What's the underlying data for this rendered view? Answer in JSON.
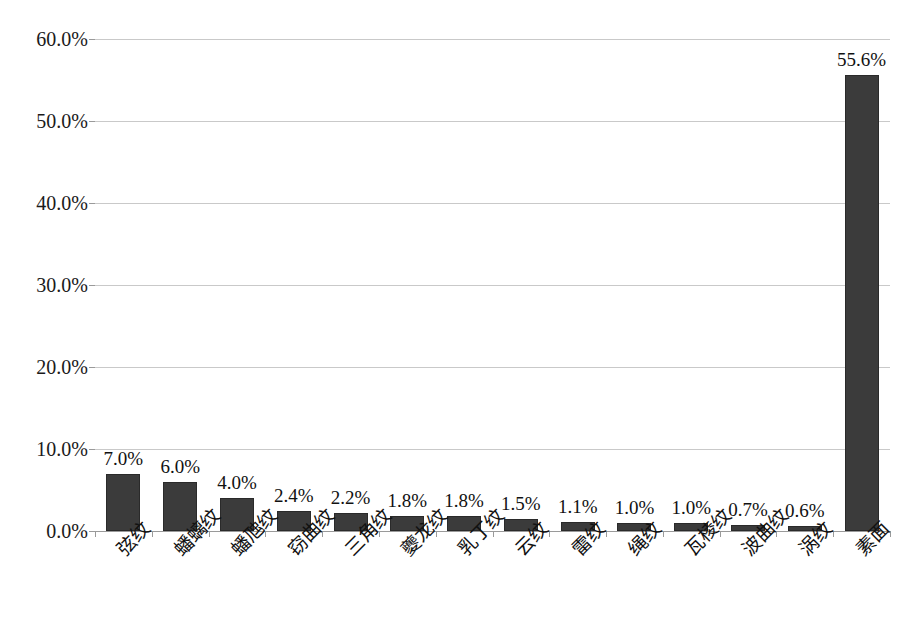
{
  "chart_data": {
    "type": "bar",
    "title": "",
    "subtitle": "",
    "xlabel": "",
    "ylabel": "",
    "ylim": [
      0,
      60
    ],
    "grid": true,
    "legend": "none",
    "orientation": "vertical",
    "bar_color": "#3b3b3b",
    "categories": [
      "弦纹",
      "蟠螭纹",
      "蟠虺纹",
      "窃曲纹",
      "三角纹",
      "夔龙纹",
      "乳丁纹",
      "云纹",
      "雷纹",
      "绳纹",
      "瓦棱纹",
      "波曲纹",
      "涡纹",
      "素面"
    ],
    "values": [
      7.0,
      6.0,
      4.0,
      2.4,
      2.2,
      1.8,
      1.8,
      1.5,
      1.1,
      1.0,
      1.0,
      0.7,
      0.6,
      55.6
    ],
    "data_labels": [
      "7.0%",
      "6.0%",
      "4.0%",
      "2.4%",
      "2.2%",
      "1.8%",
      "1.8%",
      "1.5%",
      "1.1%",
      "1.0%",
      "1.0%",
      "0.7%",
      "0.6%",
      "55.6%"
    ],
    "y_ticks": [
      0,
      10,
      20,
      30,
      40,
      50,
      60
    ],
    "y_tick_labels": [
      "0.0%",
      "10.0%",
      "20.0%",
      "30.0%",
      "40.0%",
      "50.0%",
      "60.0%"
    ]
  },
  "caption": ""
}
